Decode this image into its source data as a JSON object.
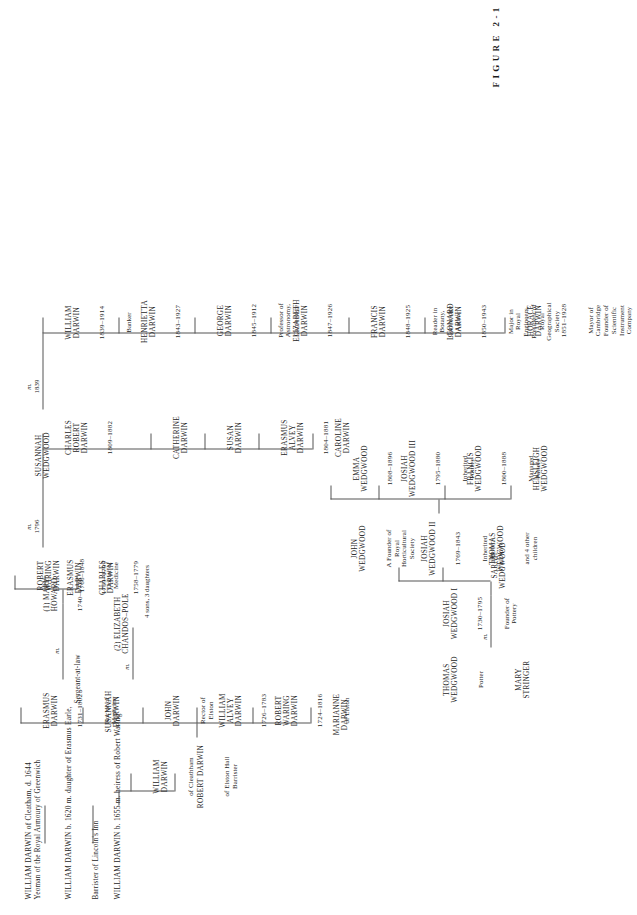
{
  "figure": {
    "caption": "FIGURE 2-1",
    "orientation": "rotated-90-ccw"
  },
  "header_lines": [
    {
      "id": "william-darwin-cleatham-1644",
      "line1": "WILLIAM DARWIN of Cleatham, d. 1644",
      "line2": "Yeoman of the Royal Armoury of Greenwich"
    },
    {
      "id": "william-darwin-1620",
      "line1": "WILLIAM DARWIN b. 1620 m. daughter of Erasmus Earle,",
      "line2": "Barrister of Lincoln's Inn",
      "line3": "Sergeant-at-law"
    },
    {
      "id": "william-darwin-1655",
      "line1": "WILLIAM DARWIN b. 1655 m. heiress of Robert Waring"
    }
  ],
  "generation_3": [
    {
      "id": "william-darwin-cleathham",
      "name": "WILLIAM\nDARWIN",
      "desc": "of Cleathham"
    },
    {
      "id": "robert-darwin-elston-hall",
      "name": "ROBERT DARWIN",
      "desc": "of Elston Hall\nBarrister"
    }
  ],
  "generation_4": [
    {
      "id": "marianne-darwin",
      "name": "MARIANNE\nDARWIN",
      "dates": "",
      "desc": ""
    },
    {
      "id": "robert-waring-darwin",
      "name": "ROBERT\nWARING\nDARWIN",
      "dates": "1724–1816",
      "desc": "of Elston"
    },
    {
      "id": "william-alvey-darwin",
      "name": "WILLIAM\nALVEY\nDARWIN",
      "dates": "1726–1783",
      "desc": ""
    },
    {
      "id": "john-darwin",
      "name": "JOHN\nDARWIN",
      "dates": "",
      "desc": "Rector of\nElston"
    },
    {
      "id": "susannah-darwin",
      "name": "SUSANNAH\nDARWIN",
      "dates": "",
      "desc": ""
    },
    {
      "id": "erasmus-darwin",
      "name": "ERASMUS\nDARWIN",
      "dates": "1731–1802",
      "desc": "Doctor of\nMedicine"
    }
  ],
  "erasmus_marriages": {
    "marriage1_symbol": "m.",
    "wife1": {
      "id": "mary-howard",
      "name": "(1) MARY\nHOWARD",
      "dates": "1740–1770"
    },
    "marriage2_symbol": "m.",
    "wife2": {
      "id": "elizabeth-chandos-pole",
      "name": "(2) ELIZABETH\nCHANDOS–POLE",
      "dates": ""
    },
    "other_issue": "4 sons, 3 daughters"
  },
  "generation_5_darwin": [
    {
      "id": "caroline-darwin",
      "name": "CAROLINE\nDARWIN",
      "dates": "",
      "desc": ""
    },
    {
      "id": "erasmus-alvey-darwin",
      "name": "ERASMUS\nALVEY\nDARWIN",
      "dates": "1804–1881",
      "desc": ""
    },
    {
      "id": "susan-darwin",
      "name": "SUSAN\nDARWIN",
      "dates": "",
      "desc": ""
    },
    {
      "id": "catherine-darwin",
      "name": "CATHERINE\nDARWIN",
      "dates": "",
      "desc": ""
    },
    {
      "id": "charles-darwin-1758",
      "name": "CHARLES\nDARWIN",
      "dates": "1758–1779",
      "desc": ""
    },
    {
      "id": "erasmus-darwin-1759",
      "name": "ERASMUS\nDARWIN",
      "dates": "1759–1799",
      "desc": ""
    },
    {
      "id": "robert-waring-darwin-1766",
      "name": "ROBERT\nWARING\nDARWIN",
      "dates": "1766–1848",
      "desc": "Doctor of\nMedicine"
    },
    {
      "id": "charles-robert-darwin",
      "name": "CHARLES\nROBERT\nDARWIN",
      "dates": "1809–1882",
      "desc": ""
    }
  ],
  "marriage_rwd_sw": {
    "symbol": "m.",
    "year": "1796",
    "spouse": {
      "id": "susannah-wedgwood",
      "name": "SUSANNAH\nWEDGWOOD"
    }
  },
  "marriage_crd_ew": {
    "symbol": "m.",
    "year": "1839"
  },
  "wedgwood_top": [
    {
      "id": "thomas-wedgwood-potter",
      "name": "THOMAS\nWEDGWOOD",
      "desc": "Potter"
    },
    {
      "id": "mary-stringer",
      "name": "MARY\nSTRINGER",
      "desc": ""
    }
  ],
  "marriage_thomas_mary": {
    "symbol": "m."
  },
  "wedgwood_gen2": [
    {
      "id": "josiah-wedgwood-i",
      "name": "JOSIAH\nWEDGWOOD I",
      "dates": "1730–1795",
      "desc": "Founder of\nPottery"
    },
    {
      "id": "sarah-wedgwood",
      "name": "SARAH\nWEDGWOOD",
      "dates": "",
      "desc": ""
    }
  ],
  "wedgwood_gen3": [
    {
      "id": "john-wedgwood",
      "name": "JOHN\nWEDGWOOD",
      "dates": "",
      "desc": "A Founder of\nRoyal\nHorticultural\nSociety"
    },
    {
      "id": "josiah-wedgwood-ii",
      "name": "JOSIAH\nWEDGWOOD II",
      "dates": "1769–1843",
      "desc": "Inherited\nPottery"
    },
    {
      "id": "thomas-wedgwood-4-other",
      "name": "THOMAS\nWEDGWOOD",
      "dates": "",
      "desc": "and 4 other\nchildren"
    }
  ],
  "wedgwood_gen4": [
    {
      "id": "emma-wedgwood",
      "name": "EMMA\nWEDGWOOD",
      "dates": "1808–1896",
      "desc": ""
    },
    {
      "id": "josiah-wedgwood-iii",
      "name": "JOSIAH\nWEDGWOOD III",
      "dates": "1795–1880",
      "desc": "Inherited\nPottery"
    },
    {
      "id": "francis-wedgwood",
      "name": "FRANCIS\nWEDGWOOD",
      "dates": "1800–1888",
      "desc": "Managed\nPottery"
    },
    {
      "id": "hensleigh-wedgwood",
      "name": "HENSLEIGH\nWEDGWOOD",
      "dates": "",
      "desc": ""
    }
  ],
  "generation_6_children": [
    {
      "id": "william-darwin-1839",
      "name": "WILLIAM\nDARWIN",
      "dates": "1839–1914",
      "desc": "Banker"
    },
    {
      "id": "henrietta-darwin",
      "name": "HENRIETTA\nDARWIN",
      "dates": "1843–1927",
      "desc": ""
    },
    {
      "id": "george-darwin",
      "name": "GEORGE\nDARWIN",
      "dates": "1845–1912",
      "desc": "Professor of\nAstronomy,\nCambridge"
    },
    {
      "id": "elizabeth-darwin",
      "name": "ELIZABETH\nDARWIN",
      "dates": "1847–1926",
      "desc": ""
    },
    {
      "id": "francis-darwin",
      "name": "FRANCIS\nDARWIN",
      "dates": "1848–1925",
      "desc": "Reader in\nBotany,\nCambridge\nAuthor"
    },
    {
      "id": "leonard-darwin",
      "name": "LEONARD\nDARWIN",
      "dates": "1850–1943",
      "desc": "Major in\nRoyal\nEngineers,\nPresident of\nRoyal\nGeographical\nSociety"
    },
    {
      "id": "horace-darwin",
      "name": "HORACE\nDARWIN",
      "dates": "1851–1928",
      "desc": "Mayor of\nCambridge\nFounder of\nScientific\nInstrument\nCompany"
    }
  ],
  "colors": {
    "ink": "#262626",
    "rule": "#555555",
    "paper": "#ffffff"
  }
}
